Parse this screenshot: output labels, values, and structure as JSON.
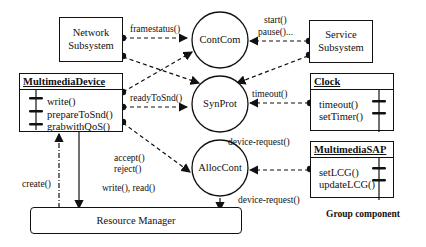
{
  "diagram": {
    "boxes": {
      "network": {
        "line1": "Network",
        "line2": "Subsystem"
      },
      "service": {
        "line1": "Service",
        "line2": "Subsystem"
      }
    },
    "classes": {
      "multimedia_device": {
        "title": "MultimediaDevice",
        "methods": [
          "write()",
          "prepareToSnd()",
          "grabwithQoS()"
        ]
      },
      "clock": {
        "title": "Clock",
        "methods": [
          "timeout()",
          "setTimer()"
        ]
      },
      "multimedia_sap": {
        "title": "MultimediaSAP",
        "methods": [
          "setLCG()",
          "updateLCG()"
        ]
      }
    },
    "circles": {
      "contcom": "ContCom",
      "synprot": "SynProt",
      "alloccont": "AllocCont"
    },
    "resource_manager": "Resource Manager",
    "labels": {
      "framestatus": "framestatus()",
      "start": "start()",
      "pause": "pause()...",
      "ready_to_snd": "readyToSnd()",
      "timeout": "timeout()",
      "device_request_1": "device-request()",
      "device_request_2": "device-request()",
      "accept": "accept()",
      "reject": "reject()",
      "write_read": "write(), read()",
      "create": "create()"
    },
    "caption": "Group component"
  }
}
